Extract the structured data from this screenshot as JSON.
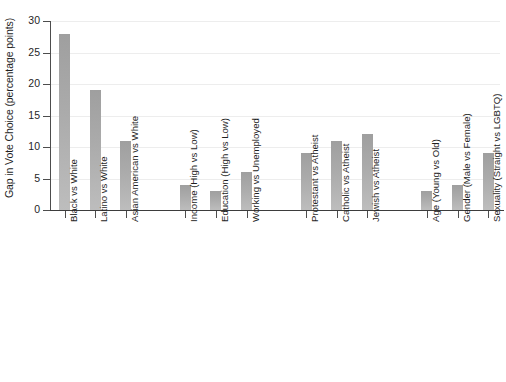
{
  "chart_data": {
    "type": "bar",
    "title": "",
    "subtitle": "",
    "xlabel": "",
    "ylabel": "Gap in Vote Choice (percentage points)",
    "ylim": [
      0,
      30
    ],
    "ytick_values": [
      0,
      5,
      10,
      15,
      20,
      25,
      30
    ],
    "ytick_labels": [
      "0",
      "5",
      "10",
      "15",
      "20",
      "25",
      "30"
    ],
    "grid": "horizontal",
    "legend": "none",
    "bar_color": "#ababab",
    "axis_color": "#4d4d4d",
    "gridline_color": "#ededed",
    "background_color": "#ffffff",
    "categories": [
      "Black vs White",
      "Latino vs White",
      "Asian American vs White",
      "Income (High vs Low)",
      "Education (High vs Low)",
      "Working vs Unemployed",
      "Protestant vs Atheist",
      "Catholic vs Atheist",
      "Jewish vs Atheist",
      "Age (Young vs Old)",
      "Gender (Male vs Female)",
      "Sexuality (Straight vs LGBTQ)",
      "Marital Status",
      "Democrat vs Republican",
      "Liberal vs Conservative"
    ],
    "values": [
      28,
      19,
      11,
      4,
      3,
      6,
      9,
      11,
      12,
      3,
      4,
      9,
      3,
      19,
      18
    ],
    "groups": [
      {
        "name": "race",
        "indices": [
          0,
          1,
          2
        ]
      },
      {
        "name": "class",
        "indices": [
          3,
          4,
          5
        ]
      },
      {
        "name": "religion",
        "indices": [
          6,
          7,
          8
        ]
      },
      {
        "name": "demographics",
        "indices": [
          9,
          10,
          11,
          12
        ]
      },
      {
        "name": "politics",
        "indices": [
          13,
          14
        ]
      }
    ]
  }
}
